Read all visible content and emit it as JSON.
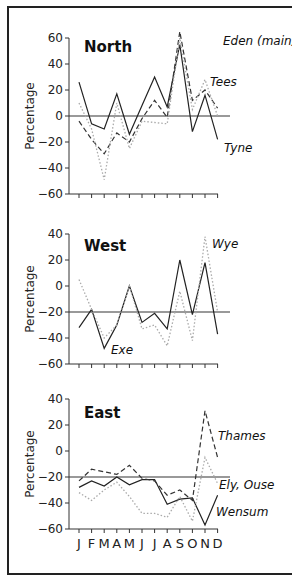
{
  "chart_data": [
    {
      "type": "line",
      "title": "North",
      "xlabel": "",
      "ylabel": "Percentage",
      "ylim": [
        -60,
        60
      ],
      "yticks": [
        60,
        40,
        20,
        0,
        -20,
        -40,
        -60
      ],
      "reference_line": 0,
      "categories": [
        "J",
        "F",
        "M",
        "A",
        "M",
        "J",
        "J",
        "A",
        "S",
        "O",
        "N",
        "D"
      ],
      "series": [
        {
          "name": "Tyne",
          "style": "solid",
          "values": [
            26,
            -6,
            -10,
            17,
            -14,
            8,
            30,
            7,
            55,
            -12,
            16,
            -18
          ]
        },
        {
          "name": "Tees",
          "style": "dashed",
          "values": [
            -4,
            -18,
            -29,
            -13,
            -20,
            -2,
            12,
            -1,
            65,
            12,
            20,
            6
          ]
        },
        {
          "name": "Eden (main)",
          "style": "dotted",
          "values": [
            10,
            -10,
            -49,
            10,
            -25,
            -4,
            -5,
            -6,
            60,
            5,
            28,
            0
          ]
        }
      ],
      "labels": [
        {
          "text": "Eden (main)",
          "x": 223,
          "y": 45
        },
        {
          "text": "Tees",
          "x": 210,
          "y": 86
        },
        {
          "text": "Tyne",
          "x": 224,
          "y": 152
        }
      ]
    },
    {
      "type": "line",
      "title": "West",
      "xlabel": "",
      "ylabel": "Percentage",
      "ylim": [
        -60,
        40
      ],
      "yticks": [
        40,
        20,
        0,
        -20,
        -40,
        -60
      ],
      "reference_line": -20,
      "categories": [
        "J",
        "F",
        "M",
        "A",
        "M",
        "J",
        "J",
        "A",
        "S",
        "O",
        "N",
        "D"
      ],
      "series": [
        {
          "name": "Exe",
          "style": "solid",
          "values": [
            -32,
            -18,
            -48,
            -30,
            0,
            -28,
            -21,
            -33,
            20,
            -22,
            18,
            -37
          ]
        },
        {
          "name": "Wye",
          "style": "dotted",
          "values": [
            5,
            -18,
            -40,
            -30,
            0,
            -33,
            -30,
            -46,
            -4,
            -42,
            38,
            -20
          ]
        }
      ],
      "labels": [
        {
          "text": "Wye",
          "x": 212,
          "y": 248
        },
        {
          "text": "Exe",
          "x": 111,
          "y": 354
        }
      ]
    },
    {
      "type": "line",
      "title": "East",
      "xlabel": "",
      "ylabel": "Percentage",
      "ylim": [
        -60,
        40
      ],
      "yticks": [
        40,
        20,
        0,
        -20,
        -40,
        -60
      ],
      "reference_line": -20,
      "categories": [
        "J",
        "F",
        "M",
        "A",
        "M",
        "J",
        "J",
        "A",
        "S",
        "O",
        "N",
        "D"
      ],
      "series": [
        {
          "name": "Wensum",
          "style": "solid",
          "values": [
            -28,
            -23,
            -27,
            -20,
            -26,
            -22,
            -22,
            -41,
            -37,
            -36,
            -57,
            -34
          ]
        },
        {
          "name": "Thames",
          "style": "dashed",
          "values": [
            -23,
            -14,
            -16,
            -18,
            -11,
            -21,
            -23,
            -34,
            -30,
            -38,
            31,
            -5
          ]
        },
        {
          "name": "Ely, Ouse",
          "style": "dotted",
          "values": [
            -32,
            -38,
            -30,
            -24,
            -35,
            -48,
            -48,
            -51,
            -35,
            -54,
            -5,
            -25
          ]
        }
      ],
      "labels": [
        {
          "text": "Thames",
          "x": 218,
          "y": 440
        },
        {
          "text": "Ely, Ouse",
          "x": 219,
          "y": 489
        },
        {
          "text": "Wensum",
          "x": 216,
          "y": 516
        }
      ]
    }
  ],
  "panels": {
    "north": {
      "title": "North",
      "ylabel": "Percentage"
    },
    "west": {
      "title": "West",
      "ylabel": "Percentage"
    },
    "east": {
      "title": "East",
      "ylabel": "Percentage"
    }
  },
  "x_axis_labels": [
    "J",
    "F",
    "M",
    "A",
    "M",
    "J",
    "J",
    "A",
    "S",
    "O",
    "N",
    "D"
  ]
}
